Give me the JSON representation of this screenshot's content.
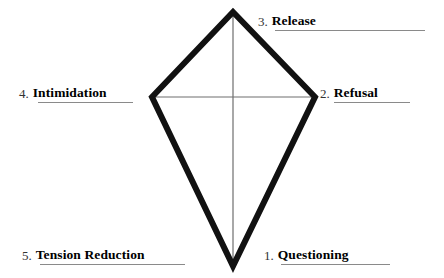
{
  "diagram": {
    "background_color": "#ffffff",
    "outline_color": "#111111",
    "diagonal_color": "#6e6e6e",
    "underline_color": "#8a8a8a",
    "shape": "kite",
    "vertices": {
      "top": {
        "x": 233,
        "y": 12
      },
      "right": {
        "x": 315,
        "y": 97
      },
      "bottom": {
        "x": 233,
        "y": 266
      },
      "left": {
        "x": 152,
        "y": 97
      }
    },
    "diagonals": [
      {
        "name": "vertical-diagonal",
        "from": "top",
        "to": "bottom"
      },
      {
        "name": "horizontal-diagonal",
        "from": "left",
        "to": "right"
      }
    ],
    "labels": [
      {
        "id": "questioning",
        "number": "1.",
        "text": "Questioning",
        "position": "bottom-right",
        "underlined": true
      },
      {
        "id": "refusal",
        "number": "2.",
        "text": "Refusal",
        "position": "right",
        "underlined": true
      },
      {
        "id": "release",
        "number": "3.",
        "text": "Release",
        "position": "top-right",
        "underlined": true
      },
      {
        "id": "intimidation",
        "number": "4.",
        "text": "Intimidation",
        "position": "left",
        "underlined": true
      },
      {
        "id": "tension",
        "number": "5.",
        "text": "Tension Reduction",
        "position": "bottom-left",
        "underlined": true
      }
    ]
  }
}
